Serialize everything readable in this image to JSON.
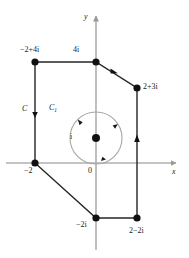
{
  "figure": {
    "axes": {
      "x_label": "x",
      "y_label": "y",
      "origin_label": "0",
      "axis_color": "#b3b3b3"
    },
    "contours": [
      {
        "name": "C",
        "label": "C",
        "orientation": "clockwise",
        "color": "#1a1a1a"
      },
      {
        "name": "C1",
        "label": "C",
        "sub": "1",
        "orientation": "clockwise",
        "color": "#9a9a9a"
      }
    ],
    "vertex_labels": {
      "top_left": "−2+4i",
      "top_center": "4i",
      "right_upper": "2+3i",
      "left_axis": "−2",
      "bottom_center": "−2i",
      "bottom_right": "2−2i",
      "circle_center": "i"
    },
    "circle": {
      "center_label": "i",
      "center_point": [
        96,
        138
      ],
      "radius": 26
    },
    "polygon_vertices": [
      {
        "label": "−2+4i",
        "px": [
          35,
          62
        ]
      },
      {
        "label": "4i",
        "px": [
          96,
          62
        ]
      },
      {
        "label": "2+3i",
        "px": [
          137,
          88
        ]
      },
      {
        "label": "2−2i",
        "px": [
          137,
          218
        ]
      },
      {
        "label": "−2i",
        "px": [
          96,
          218
        ]
      },
      {
        "label": "−2",
        "px": [
          35,
          163
        ]
      }
    ]
  }
}
